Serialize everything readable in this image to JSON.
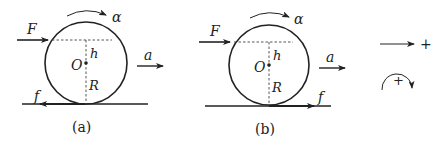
{
  "figure": {
    "panels": [
      {
        "id": "a",
        "caption": "(a)",
        "labels": {
          "force": "F",
          "angular_accel": "α",
          "height": "h",
          "center": "O",
          "radius": "R",
          "accel": "a",
          "friction": "f"
        },
        "friction_direction": "left"
      },
      {
        "id": "b",
        "caption": "(b)",
        "labels": {
          "force": "F",
          "angular_accel": "α",
          "height": "h",
          "center": "O",
          "radius": "R",
          "accel": "a",
          "friction": "f"
        },
        "friction_direction": "right"
      }
    ],
    "sign_convention": {
      "linear_positive": "+",
      "rotational_positive": "+"
    }
  }
}
